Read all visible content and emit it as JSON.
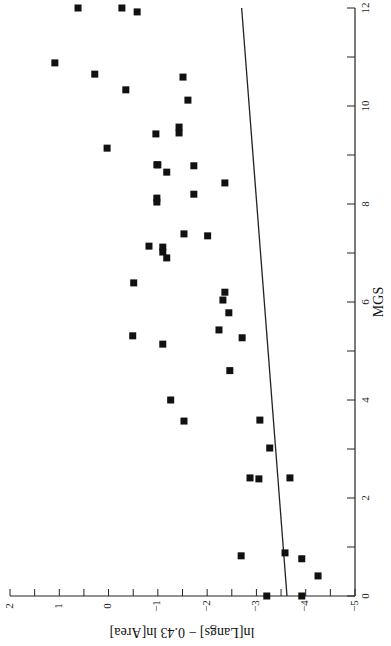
{
  "chart_data": {
    "type": "scatter",
    "title": "",
    "orientation": "rotated-90-clockwise",
    "xlabel": "MGS",
    "ylabel": "ln[Langs] − 0.43 ln[Area]",
    "xlim": [
      0,
      12
    ],
    "ylim": [
      -5,
      2
    ],
    "x_ticks": [
      0,
      2,
      4,
      6,
      8,
      10,
      12
    ],
    "x_tick_labels": [
      "0",
      "2",
      "4",
      "6",
      "8",
      "10",
      "12"
    ],
    "y_ticks": [
      2,
      1,
      0,
      -1,
      -2,
      -3,
      -4,
      -5
    ],
    "y_tick_labels": [
      "2",
      "1",
      "0",
      "−1",
      "−2",
      "−3",
      "−4",
      "−5"
    ],
    "grid": false,
    "legend": null,
    "marker": "filled-square",
    "series": [
      {
        "name": "languages",
        "points": [
          {
            "x": 12.0,
            "y": 0.62
          },
          {
            "x": 12.0,
            "y": -0.27
          },
          {
            "x": 11.92,
            "y": -0.58
          },
          {
            "x": 10.88,
            "y": 1.09
          },
          {
            "x": 10.65,
            "y": 0.28
          },
          {
            "x": 10.33,
            "y": -0.35
          },
          {
            "x": 10.59,
            "y": -1.51
          },
          {
            "x": 10.12,
            "y": -1.61
          },
          {
            "x": 9.57,
            "y": -1.43
          },
          {
            "x": 9.43,
            "y": -0.96
          },
          {
            "x": 9.45,
            "y": -1.43
          },
          {
            "x": 9.14,
            "y": 0.03
          },
          {
            "x": 8.8,
            "y": -0.98
          },
          {
            "x": 8.8,
            "y": -1.0
          },
          {
            "x": 8.65,
            "y": -1.18
          },
          {
            "x": 8.78,
            "y": -1.73
          },
          {
            "x": 8.43,
            "y": -2.36
          },
          {
            "x": 8.2,
            "y": -1.73
          },
          {
            "x": 8.12,
            "y": -0.98
          },
          {
            "x": 8.04,
            "y": -0.98
          },
          {
            "x": 7.39,
            "y": -1.53
          },
          {
            "x": 7.35,
            "y": -2.01
          },
          {
            "x": 7.14,
            "y": -0.82
          },
          {
            "x": 7.12,
            "y": -1.1
          },
          {
            "x": 7.02,
            "y": -1.1
          },
          {
            "x": 6.9,
            "y": -1.18
          },
          {
            "x": 6.39,
            "y": -0.51
          },
          {
            "x": 6.2,
            "y": -2.36
          },
          {
            "x": 6.04,
            "y": -2.32
          },
          {
            "x": 5.78,
            "y": -2.44
          },
          {
            "x": 5.43,
            "y": -2.24
          },
          {
            "x": 5.31,
            "y": -0.49
          },
          {
            "x": 5.27,
            "y": -2.71
          },
          {
            "x": 5.14,
            "y": -1.1
          },
          {
            "x": 4.6,
            "y": -2.46
          },
          {
            "x": 4.0,
            "y": -1.26
          },
          {
            "x": 3.57,
            "y": -1.53
          },
          {
            "x": 3.59,
            "y": -3.07
          },
          {
            "x": 3.02,
            "y": -3.27
          },
          {
            "x": 2.41,
            "y": -2.87
          },
          {
            "x": 2.39,
            "y": -3.05
          },
          {
            "x": 2.41,
            "y": -3.68
          },
          {
            "x": 0.82,
            "y": -2.69
          },
          {
            "x": 0.88,
            "y": -3.58
          },
          {
            "x": 0.76,
            "y": -3.92
          },
          {
            "x": 0.41,
            "y": -4.25
          },
          {
            "x": 0.0,
            "y": -3.21
          },
          {
            "x": 0.0,
            "y": -3.92
          }
        ]
      }
    ],
    "fit_line": {
      "name": "regression",
      "x": [
        0,
        12
      ],
      "y": [
        -3.62,
        -2.7
      ]
    }
  }
}
